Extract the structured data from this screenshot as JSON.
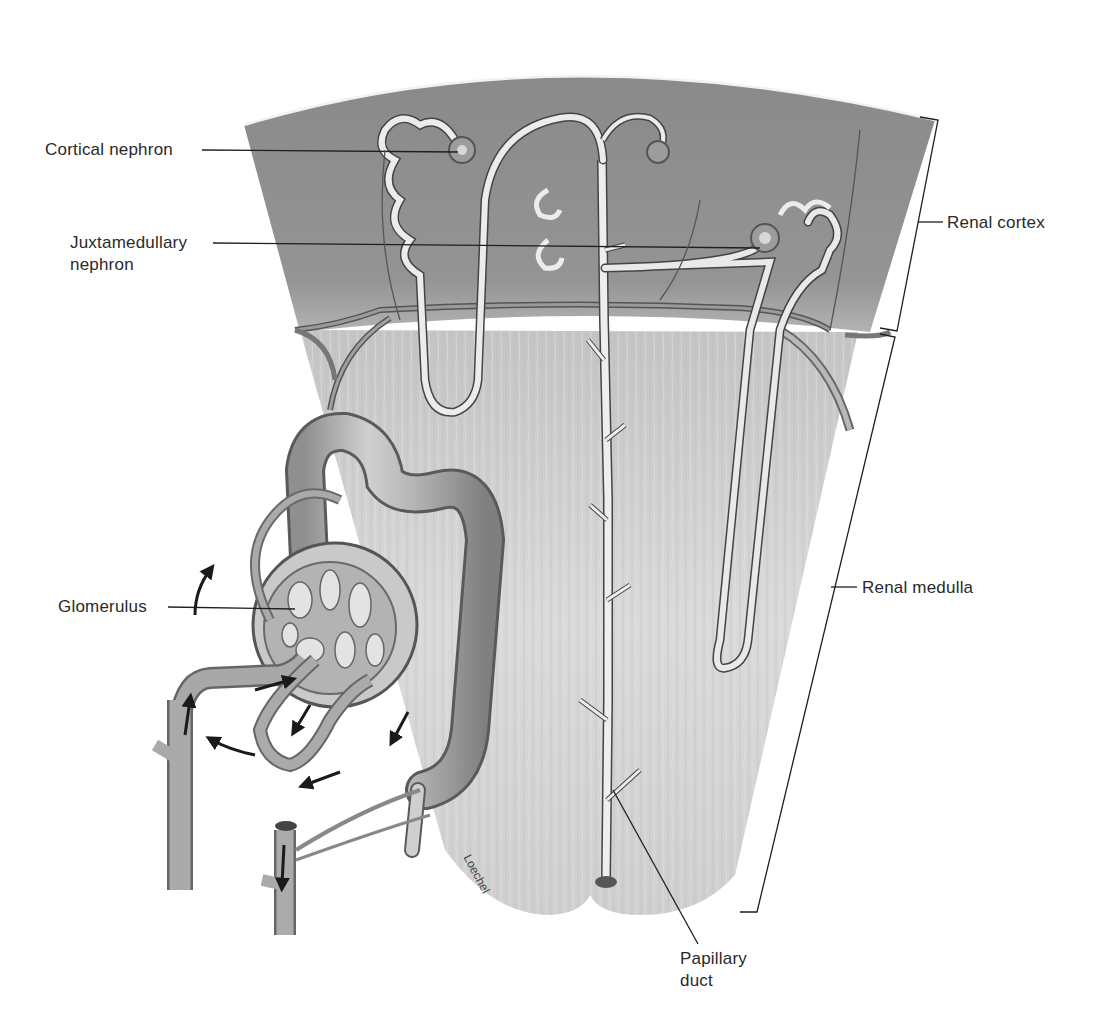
{
  "diagram": {
    "labels": {
      "cortical_nephron": "Cortical nephron",
      "juxtamedullary_nephron_line1": "Juxtamedullary",
      "juxtamedullary_nephron_line2": "nephron",
      "glomerulus": "Glomerulus",
      "renal_cortex": "Renal cortex",
      "renal_medulla": "Renal medulla",
      "papillary_duct_line1": "Papillary",
      "papillary_duct_line2": "duct"
    },
    "signature": "Loechel",
    "colors": {
      "cortex": "#8e8e8e",
      "medulla": "#d6d6d6",
      "tubule": "#e8e8e8",
      "vessel": "#a9a9a9",
      "outline": "#333333",
      "text": "#2a2a2a"
    }
  }
}
